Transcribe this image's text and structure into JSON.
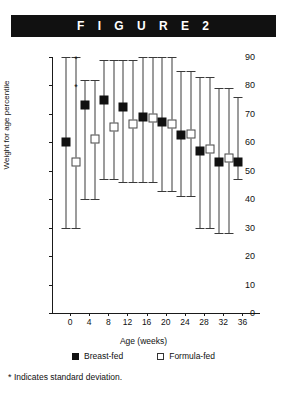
{
  "figure": {
    "banner_label": "F I G U R E   2",
    "footnote_marker": "*",
    "footnote_text": "Indicates standard deviation."
  },
  "legend": {
    "breast_label": "Breast-fed",
    "formula_label": "Formula-fed"
  },
  "colors": {
    "banner_background": "#111111",
    "banner_text": "#ffffff",
    "breast_fed_marker": "#111111",
    "formula_fed_marker": "#ffffff",
    "formula_fed_border": "#444444",
    "error_bar": "#3a3a3a",
    "axis": "#1a1a1a"
  },
  "chart_data": {
    "type": "scatter",
    "title": "F I G U R E   2",
    "xlabel": "Age (weeks)",
    "ylabel": "Weight for age percentile",
    "xlim": [
      0,
      38
    ],
    "ylim": [
      0,
      90
    ],
    "xticks": [
      0,
      4,
      8,
      12,
      16,
      20,
      24,
      28,
      32,
      36
    ],
    "xtick_labels": [
      "0",
      "4",
      "8",
      "12",
      "16",
      "20",
      "24",
      "28",
      "32",
      "36"
    ],
    "yticks": [
      0,
      10,
      20,
      30,
      40,
      50,
      60,
      70,
      80,
      90
    ],
    "ytick_labels": [
      "0",
      "10",
      "20",
      "30",
      "40",
      "50",
      "60",
      "70",
      "80",
      "90"
    ],
    "grid": false,
    "legend_position": "below-axis",
    "error_bars": "standard deviation",
    "annotations": [
      {
        "text": "*",
        "x": 0,
        "y": 90,
        "note": "marks upper standard deviation cap"
      },
      {
        "text": "*",
        "x": 0,
        "y": 80,
        "note": "marks lower standard deviation cap"
      }
    ],
    "x": [
      0,
      4,
      8,
      12,
      16,
      20,
      24,
      28,
      32,
      36
    ],
    "series": [
      {
        "name": "Breast-fed",
        "marker": "filled-square",
        "values": [
          60,
          73,
          75,
          72.5,
          69,
          67,
          62.5,
          57,
          53,
          53
        ],
        "err_low": [
          30,
          40,
          47,
          46,
          46,
          43,
          41,
          30,
          28,
          47
        ],
        "err_high": [
          90,
          82,
          89,
          89,
          90,
          90,
          85,
          83,
          79,
          76
        ]
      },
      {
        "name": "Formula-fed",
        "marker": "open-square",
        "values": [
          53,
          61,
          65.5,
          66.5,
          68.5,
          66.5,
          63,
          57.5,
          54.5,
          null
        ],
        "err_low": [
          30,
          40,
          47,
          46,
          46,
          43,
          41,
          30,
          28,
          null
        ],
        "err_high": [
          90,
          82,
          89,
          89,
          90,
          90,
          85,
          83,
          79,
          null
        ]
      }
    ]
  }
}
